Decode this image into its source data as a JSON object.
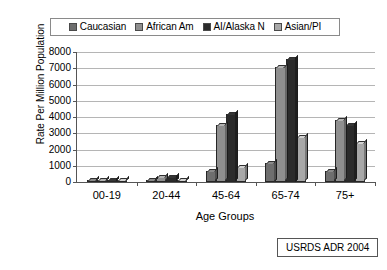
{
  "chart_data": {
    "type": "bar",
    "title": "",
    "xlabel": "Age Groups",
    "ylabel": "Rate Per Million Population",
    "categories": [
      "00-19",
      "20-44",
      "45-64",
      "65-74",
      "75+"
    ],
    "ylim": [
      0,
      8000
    ],
    "ytick_values": [
      0,
      1000,
      2000,
      3000,
      4000,
      5000,
      6000,
      7000,
      8000
    ],
    "ytick_labels": [
      "0",
      "1000",
      "2000",
      "3000",
      "4000",
      "5000",
      "6000",
      "7000",
      "8000"
    ],
    "grid": true,
    "legend_position": "top",
    "series": [
      {
        "name": "Caucasian",
        "color": "#6e6e6e",
        "values": [
          50,
          150,
          700,
          1200,
          700
        ]
      },
      {
        "name": "African Am",
        "color": "#8f8f8f",
        "values": [
          60,
          300,
          3500,
          7100,
          3800
        ]
      },
      {
        "name": "AI/Alaska N",
        "color": "#2b2b2b",
        "values": [
          50,
          300,
          4200,
          7600,
          3500
        ]
      },
      {
        "name": "Asian/PI",
        "color": "#a8a8a8",
        "values": [
          30,
          100,
          950,
          2750,
          2400
        ]
      }
    ],
    "annotations": [
      {
        "text": "USRDS ADR 2004"
      }
    ]
  },
  "legend": {
    "items": [
      {
        "label": "Caucasian",
        "color": "#6e6e6e"
      },
      {
        "label": "African Am",
        "color": "#8f8f8f"
      },
      {
        "label": "AI/Alaska N",
        "color": "#2b2b2b"
      },
      {
        "label": "Asian/PI",
        "color": "#a8a8a8"
      }
    ]
  },
  "axes": {
    "y_title": "Rate Per Million Population",
    "x_title": "Age Groups"
  },
  "source": {
    "label": "USRDS ADR 2004"
  }
}
